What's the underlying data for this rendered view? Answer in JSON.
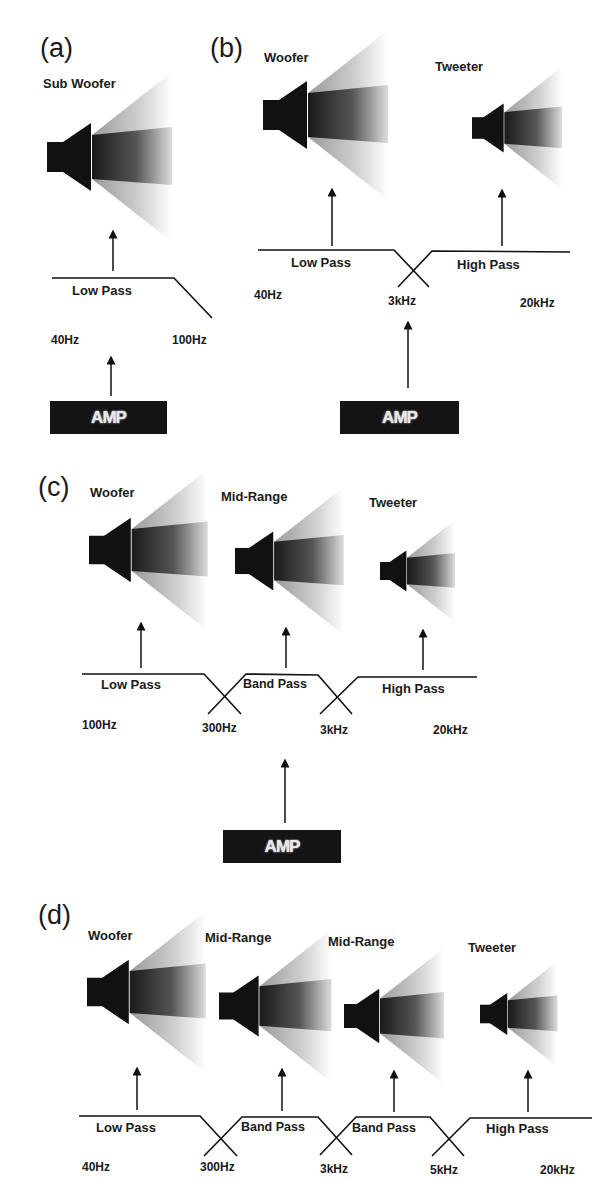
{
  "panels": {
    "a": {
      "label": "(a)",
      "speakers": [
        {
          "name": "Sub Woofer"
        }
      ],
      "filters": [
        {
          "name": "Low Pass"
        }
      ],
      "frequencies": [
        "40Hz",
        "100Hz"
      ],
      "amp": "AMP"
    },
    "b": {
      "label": "(b)",
      "speakers": [
        {
          "name": "Woofer"
        },
        {
          "name": "Tweeter"
        }
      ],
      "filters": [
        {
          "name": "Low Pass"
        },
        {
          "name": "High Pass"
        }
      ],
      "frequencies": [
        "40Hz",
        "3kHz",
        "20kHz"
      ],
      "amp": "AMP"
    },
    "c": {
      "label": "(c)",
      "speakers": [
        {
          "name": "Woofer"
        },
        {
          "name": "Mid-Range"
        },
        {
          "name": "Tweeter"
        }
      ],
      "filters": [
        {
          "name": "Low Pass"
        },
        {
          "name": "Band Pass"
        },
        {
          "name": "High Pass"
        }
      ],
      "frequencies": [
        "100Hz",
        "300Hz",
        "3kHz",
        "20kHz"
      ],
      "amp": "AMP"
    },
    "d": {
      "label": "(d)",
      "speakers": [
        {
          "name": "Woofer"
        },
        {
          "name": "Mid-Range"
        },
        {
          "name": "Mid-Range"
        },
        {
          "name": "Tweeter"
        }
      ],
      "filters": [
        {
          "name": "Low Pass"
        },
        {
          "name": "Band Pass"
        },
        {
          "name": "Band Pass"
        },
        {
          "name": "High Pass"
        }
      ],
      "frequencies": [
        "40Hz",
        "300Hz",
        "3kHz",
        "5kHz",
        "20kHz"
      ]
    }
  },
  "colors": {
    "ink": "#1a1a1a",
    "amp_bg": "#141414",
    "amp_text": "#e8e8e8"
  }
}
